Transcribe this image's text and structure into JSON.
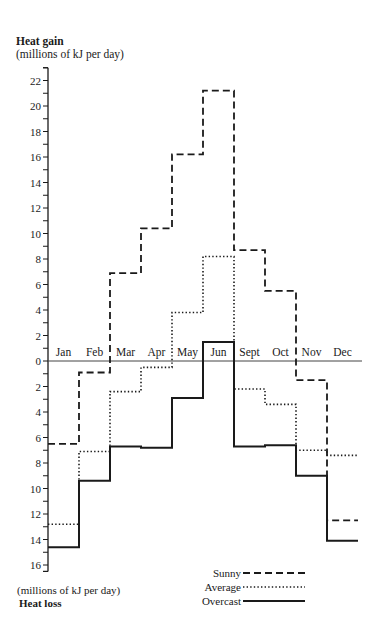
{
  "chart_data": {
    "type": "line",
    "subtype": "step",
    "title": "Heat gain",
    "ylabel_top": "(millions of kJ per day)",
    "ylabel_bottom": "(millions of kJ per day)",
    "bottom_title": "Heat loss",
    "categories": [
      "Jan",
      "Feb",
      "Mar",
      "Apr",
      "May",
      "Jun",
      "Sept",
      "Oct",
      "Nov",
      "Dec"
    ],
    "series": [
      {
        "name": "Sunny",
        "style": "dashed",
        "values": [
          -6.5,
          -0.9,
          6.9,
          10.4,
          16.2,
          21.2,
          8.7,
          5.5,
          -1.5,
          -12.5
        ]
      },
      {
        "name": "Average",
        "style": "dotted",
        "values": [
          -12.8,
          -7.1,
          -2.4,
          -0.5,
          3.8,
          8.2,
          -2.2,
          -3.4,
          -7.0,
          -7.4
        ]
      },
      {
        "name": "Overcast",
        "style": "solid",
        "values": [
          -14.6,
          -9.4,
          -6.7,
          -6.8,
          -2.9,
          1.5,
          -6.7,
          -6.6,
          -9.0,
          -14.1
        ]
      }
    ],
    "y_ticks_gain": [
      2,
      4,
      6,
      8,
      10,
      12,
      14,
      16,
      18,
      20,
      22
    ],
    "y_ticks_loss": [
      0,
      2,
      4,
      6,
      8,
      10,
      12,
      14,
      16
    ],
    "ylim": [
      -16.5,
      23
    ],
    "grid": false,
    "legend_position": "bottom-right"
  },
  "legend": {
    "items": [
      {
        "label": "Sunny",
        "style": "dashed"
      },
      {
        "label": "Average",
        "style": "dotted"
      },
      {
        "label": "Overcast",
        "style": "solid"
      }
    ]
  },
  "colors": {
    "ink": "#1a1a1a",
    "background": "#ffffff"
  }
}
